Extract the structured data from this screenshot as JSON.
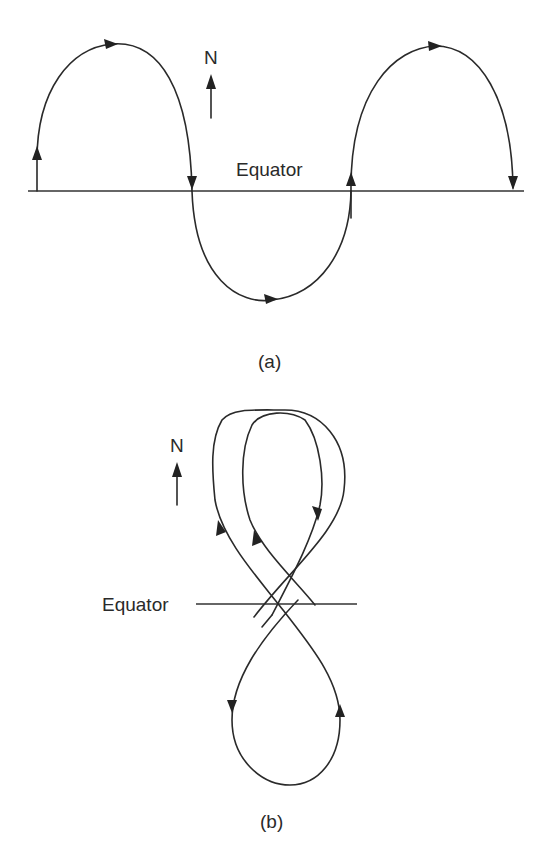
{
  "figure_a": {
    "caption": "(a)",
    "equator_label": "Equator",
    "north_label": "N",
    "description": "Sinusoidal-like track crossing the equator: northward arc, southward arc, northward arc, with direction arrows"
  },
  "figure_b": {
    "caption": "(b)",
    "equator_label": "Equator",
    "north_label": "N",
    "description": "Figure-eight track with two overlapping northern loops and one southern loop, crossing near the equator"
  },
  "colors": {
    "line": "#2a2a2a",
    "background": "#ffffff"
  }
}
